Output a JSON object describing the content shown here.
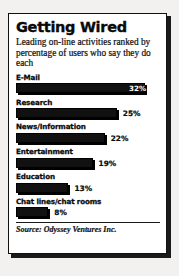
{
  "figure": {
    "title": "Getting Wired",
    "subtitle": "Leading on-line activities ranked by percentage of users who say they do each",
    "source": "Source: Odyssey Ventures Inc."
  },
  "chart_data": {
    "type": "bar",
    "orientation": "horizontal",
    "title": "Getting Wired",
    "subtitle": "Leading on-line activities ranked by percentage of users who say they do each",
    "xlabel": "",
    "ylabel": "",
    "xlim": [
      0,
      34
    ],
    "grid": false,
    "legend": false,
    "value_suffix": "%",
    "categories": [
      "E-Mail",
      "Research",
      "News/Information",
      "Entertainment",
      "Education",
      "Chat lines/chat rooms"
    ],
    "values": [
      32,
      25,
      22,
      19,
      13,
      8
    ],
    "value_labels": [
      "32%",
      "25%",
      "22%",
      "19%",
      "13%",
      "8%"
    ],
    "label_placement": [
      "inside",
      "outside",
      "outside",
      "outside",
      "outside",
      "outside"
    ],
    "bar_color": "#111111",
    "bar_shadow_color": "#000000",
    "inside_label_color": "#ffffff",
    "outside_label_color": "#0a0a0a",
    "background_color": "#ffffff",
    "source": "Source: Odyssey Ventures Inc."
  }
}
